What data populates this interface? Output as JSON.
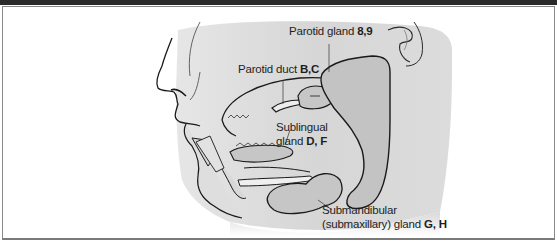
{
  "diagram": {
    "labels": {
      "parotid_gland": {
        "name": "Parotid gland",
        "refs": "8,9"
      },
      "parotid_duct": {
        "name": "Parotid duct",
        "refs": "B,C"
      },
      "sublingual_gland": {
        "name_line1": "Sublingual",
        "name_line2": "gland",
        "refs": "D, F"
      },
      "submandibular_gland": {
        "name_line1": "Submandibular",
        "name_line2": "(submaxillary) gland",
        "refs": "G, H"
      }
    },
    "colors": {
      "skin": "#d9d9d9",
      "gland": "#c8c8c8",
      "outline": "#1a1a1a",
      "frame": "#8a8a8a"
    }
  }
}
